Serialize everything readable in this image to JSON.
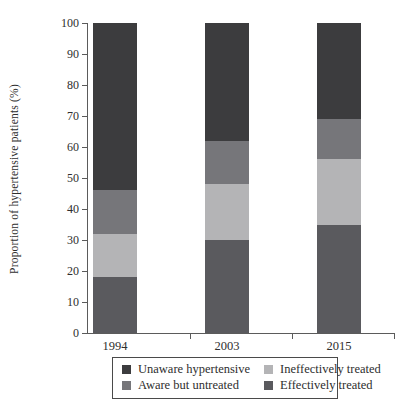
{
  "chart_data": {
    "type": "bar",
    "stacked": true,
    "categories": [
      "1994",
      "2003",
      "2015"
    ],
    "series": [
      {
        "name": "Effectively treated",
        "color": "#5a5a5e",
        "values": [
          18,
          30,
          35
        ]
      },
      {
        "name": "Ineffectively treated",
        "color": "#b4b4b6",
        "values": [
          14,
          18,
          21
        ]
      },
      {
        "name": "Aware but untreated",
        "color": "#76767a",
        "values": [
          14,
          14,
          13
        ]
      },
      {
        "name": "Unaware hypertensive",
        "color": "#3c3c3e",
        "values": [
          54,
          38,
          31
        ]
      }
    ],
    "title": "",
    "xlabel": "",
    "ylabel": "Proportion of hypertensive patients (%)",
    "ylim": [
      0,
      100
    ],
    "ytick_interval": 10,
    "grid": "off",
    "legend_position": "bottom"
  },
  "legend": {
    "items": [
      {
        "label": "Unaware hypertensive",
        "color": "#3c3c3e"
      },
      {
        "label": "Ineffectively treated",
        "color": "#b4b4b6"
      },
      {
        "label": "Aware but untreated",
        "color": "#76767a"
      },
      {
        "label": "Effectively treated",
        "color": "#5a5a5e"
      }
    ]
  }
}
